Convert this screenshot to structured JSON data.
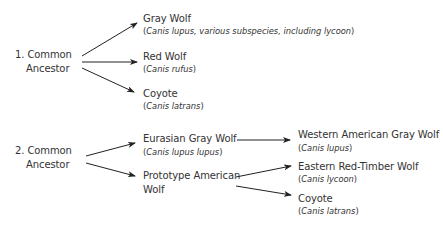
{
  "colors": {
    "text": "#333333",
    "arrow": "#222222",
    "background": "#ffffff"
  },
  "diagram1": {
    "ancestor": {
      "line1": "1. Common",
      "line2": "Ancestor"
    },
    "descendants": [
      {
        "name": "Gray Wolf",
        "sci_open": "(",
        "sci_italic": "Canis lupus, various subspecies, including lycoon",
        "sci_close": ")"
      },
      {
        "name": "Red Wolf",
        "sci_open": "(",
        "sci_italic": "Canis rufus",
        "sci_close": ")"
      },
      {
        "name": "Coyote",
        "sci_open": "(",
        "sci_italic": "Canis latrans",
        "sci_close": ")"
      }
    ]
  },
  "diagram2": {
    "ancestor": {
      "line1": "2. Common",
      "line2": "Ancestor"
    },
    "intermediates": [
      {
        "name": "Eurasian Gray Wolf",
        "sci_open": "(",
        "sci_italic": "Canis lupus lupus",
        "sci_close": ")"
      },
      {
        "name_line1": "Prototype American",
        "name_line2": "Wolf"
      }
    ],
    "descendants": [
      {
        "name": "Western American Gray Wolf",
        "sci_open": "(",
        "sci_italic": "Canis lupus",
        "sci_close": ")"
      },
      {
        "name": "Eastern Red-Timber Wolf",
        "sci_open": "(",
        "sci_italic": "Canis lycoon",
        "sci_close": ")"
      },
      {
        "name": "Coyote",
        "sci_open": "(",
        "sci_italic": "Canis latrans",
        "sci_close": ")"
      }
    ]
  }
}
